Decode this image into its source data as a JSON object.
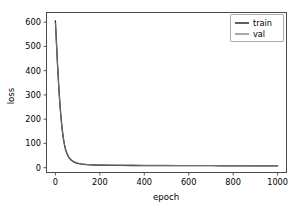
{
  "chart_data": {
    "type": "line",
    "title": "",
    "xlabel": "epoch",
    "ylabel": "loss",
    "xlim": [
      -40,
      1040
    ],
    "ylim": [
      -20,
      640
    ],
    "xticks": [
      0,
      200,
      400,
      600,
      800,
      1000
    ],
    "xtick_labels": [
      "0",
      "200",
      "400",
      "600",
      "800",
      "1000"
    ],
    "yticks": [
      0,
      100,
      200,
      300,
      400,
      500,
      600
    ],
    "ytick_labels": [
      "0",
      "100",
      "200",
      "300",
      "400",
      "500",
      "600"
    ],
    "grid": false,
    "legend_position": "upper right",
    "legend_entries": [
      "train",
      "val"
    ],
    "series": [
      {
        "name": "train",
        "color": "#1a1a1a",
        "linewidth": 1.3,
        "x": [
          0,
          5,
          10,
          15,
          20,
          25,
          30,
          35,
          40,
          45,
          50,
          60,
          70,
          80,
          90,
          100,
          120,
          140,
          160,
          180,
          200,
          250,
          300,
          350,
          400,
          450,
          500,
          550,
          600,
          650,
          700,
          750,
          800,
          850,
          900,
          950,
          1000
        ],
        "y": [
          605,
          512,
          420,
          338,
          268,
          210,
          163,
          126,
          98,
          77,
          62,
          43,
          32,
          25,
          21,
          18,
          14.5,
          12.6,
          11.5,
          10.8,
          10.3,
          9.6,
          9.2,
          8.9,
          8.7,
          8.5,
          8.4,
          8.3,
          8.2,
          8.1,
          8.0,
          7.9,
          7.8,
          7.7,
          7.6,
          7.5,
          7.4
        ]
      },
      {
        "name": "val",
        "color": "#6e6e6e",
        "linewidth": 1.1,
        "x": [
          0,
          5,
          10,
          15,
          20,
          25,
          30,
          35,
          40,
          45,
          50,
          60,
          70,
          80,
          90,
          100,
          120,
          140,
          160,
          180,
          200,
          250,
          300,
          350,
          400,
          450,
          500,
          550,
          600,
          650,
          700,
          750,
          800,
          850,
          900,
          950,
          1000
        ],
        "y": [
          598,
          508,
          417,
          336,
          267,
          209,
          163,
          127,
          99,
          78,
          63,
          44,
          33,
          26,
          22,
          19,
          15.3,
          13.4,
          12.3,
          11.6,
          11.1,
          10.4,
          10.0,
          9.7,
          9.5,
          9.3,
          9.2,
          9.1,
          9.0,
          8.9,
          8.8,
          8.7,
          8.6,
          8.6,
          8.5,
          8.5,
          8.4
        ]
      }
    ]
  },
  "axes": {
    "xlabel": "epoch",
    "ylabel": "loss"
  },
  "legend": {
    "items": [
      {
        "label": "train",
        "color": "#1a1a1a"
      },
      {
        "label": "val",
        "color": "#6e6e6e"
      }
    ]
  },
  "colors": {
    "background": "#ffffff",
    "frame": "#4a4a4a",
    "text": "#000000",
    "train": "#1a1a1a",
    "val": "#6e6e6e"
  }
}
